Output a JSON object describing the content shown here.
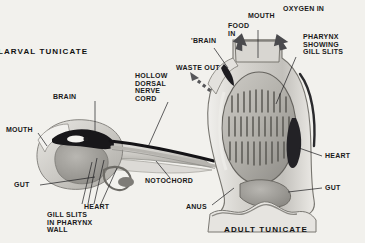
{
  "figure": {
    "caption_left": "LARVAL TUNICATE",
    "caption_right": "ADULT TUNICATE",
    "background_color": "#f2f1ed",
    "ink_color": "#1a1a1a"
  },
  "labels": {
    "larva": {
      "brain": "BRAIN",
      "mouth": "MOUTH",
      "gut": "GUT",
      "heart": "HEART",
      "gill_slits": "GILL SLITS\nIN PHARYNX\nWALL",
      "nerve_cord": "HOLLOW\nDORSAL\nNERVE\nCORD",
      "notochord": "NOTOCHORD"
    },
    "adult": {
      "brain": "'BRAIN",
      "food_in": "FOOD\nIN",
      "mouth": "MOUTH",
      "oxygen_in": "OXYGEN IN",
      "waste_out": "WASTE OUT",
      "pharynx": "PHARYNX\nSHOWING\nGILL SLITS",
      "heart": "HEART",
      "gut": "GUT",
      "anus": "ANUS"
    }
  }
}
